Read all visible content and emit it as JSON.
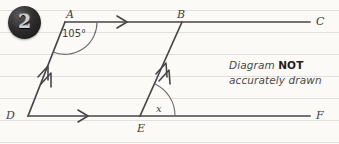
{
  "question": {
    "number": "2"
  },
  "note": {
    "line1_prefix": "Diagram ",
    "line1_emphasis": "NOT",
    "line2": "accurately drawn"
  },
  "diagram": {
    "points": [
      {
        "id": "A",
        "label": "A",
        "x": 65,
        "y": 22,
        "label_x": 66,
        "label_y": 9
      },
      {
        "id": "B",
        "label": "B",
        "x": 182,
        "y": 22,
        "label_x": 177,
        "label_y": 9
      },
      {
        "id": "C",
        "label": "C",
        "x": 310,
        "y": 22,
        "label_x": 316,
        "label_y": 17
      },
      {
        "id": "D",
        "label": "D",
        "x": 28,
        "y": 116,
        "label_x": 7,
        "label_y": 111
      },
      {
        "id": "E",
        "label": "E",
        "x": 140,
        "y": 116,
        "label_x": 138,
        "label_y": 124
      },
      {
        "id": "F",
        "label": "F",
        "x": 310,
        "y": 116,
        "label_x": 316,
        "label_y": 111
      }
    ],
    "angles": [
      {
        "id": "angle-at-A",
        "label": "105°",
        "vertex": "A",
        "label_x": 63,
        "label_y": 30
      },
      {
        "id": "angle-at-E",
        "label": "x",
        "vertex": "E",
        "label_x": 157,
        "label_y": 105
      }
    ],
    "lines": [
      {
        "id": "line-AC",
        "from": "A",
        "to": "C",
        "marks": 1
      },
      {
        "id": "line-DF",
        "from": "D",
        "to": "F",
        "marks": 1
      },
      {
        "id": "line-DA",
        "from": "D",
        "to": "A",
        "marks": 2
      },
      {
        "id": "line-EB",
        "from": "E",
        "to": "B",
        "marks": 2
      }
    ],
    "colors": {
      "stroke": "#46464a",
      "arc": "#6a6a70",
      "paper": "#fbfaf7",
      "rule": "#e2e0dd",
      "label": "#3d3d3d"
    }
  },
  "paper": {
    "rule_positions": [
      10,
      32,
      54,
      76,
      98,
      120,
      142
    ]
  }
}
